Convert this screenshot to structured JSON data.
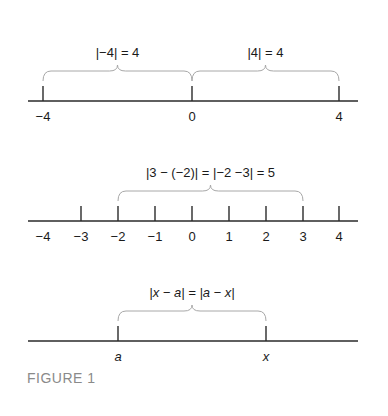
{
  "caption": "FIGURE 1",
  "diagrams": [
    {
      "name": "absolute-value-of-4",
      "axis": {
        "y": 101,
        "x1": 28,
        "x2": 358
      },
      "ticks": [
        {
          "label": "−4",
          "x": 43,
          "tick": true
        },
        {
          "label": "0",
          "x": 192,
          "tick": true
        },
        {
          "label": "4",
          "x": 339,
          "tick": true
        }
      ],
      "braces": [
        {
          "from": 43,
          "to": 192,
          "label": "|−4| = 4"
        },
        {
          "from": 192,
          "to": 339,
          "label": "|4| = 4"
        }
      ]
    },
    {
      "name": "distance-between-3-and-minus-2",
      "axis": {
        "y": 221,
        "x1": 28,
        "x2": 358
      },
      "ticks": [
        {
          "label": "−4",
          "x": 43,
          "tick": false
        },
        {
          "label": "−3",
          "x": 81,
          "tick": true
        },
        {
          "label": "−2",
          "x": 118,
          "tick": true
        },
        {
          "label": "−1",
          "x": 155,
          "tick": true
        },
        {
          "label": "0",
          "x": 192,
          "tick": true
        },
        {
          "label": "1",
          "x": 229,
          "tick": true
        },
        {
          "label": "2",
          "x": 266,
          "tick": true
        },
        {
          "label": "3",
          "x": 303,
          "tick": true
        },
        {
          "label": "4",
          "x": 339,
          "tick": true
        }
      ],
      "braces": [
        {
          "from": 118,
          "to": 303,
          "label": "|3 − (−2)| = |−2 −3| = 5"
        }
      ]
    },
    {
      "name": "distance-between-a-and-x",
      "axis": {
        "y": 341,
        "x1": 28,
        "x2": 358
      },
      "ticks": [
        {
          "label": "a",
          "x": 118,
          "tick": true,
          "italic": true
        },
        {
          "label": "x",
          "x": 266,
          "tick": true,
          "italic": true
        }
      ],
      "braces": [
        {
          "from": 118,
          "to": 266,
          "label": "|x − a| = |a − x|",
          "italic": true
        }
      ]
    }
  ]
}
